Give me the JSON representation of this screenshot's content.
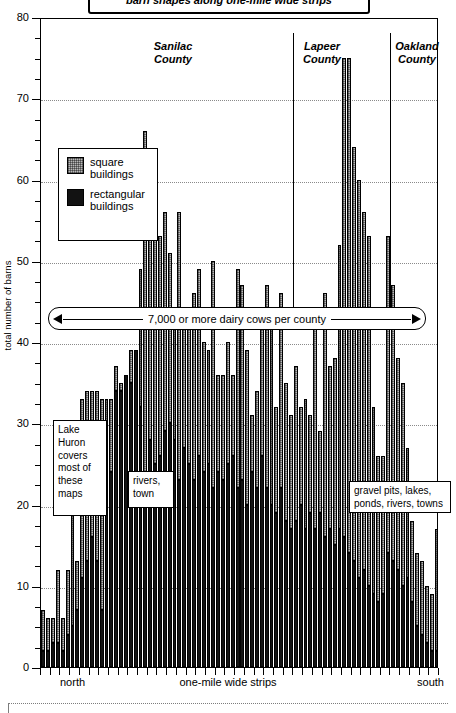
{
  "title": {
    "text": "barn shapes along one-mile wide strips"
  },
  "axes": {
    "y_title": "total number of barns",
    "y_ticks": [
      80,
      70,
      60,
      50,
      40,
      30,
      20,
      10,
      0
    ],
    "y_min": 0,
    "y_max": 80,
    "x_left_label": "north",
    "x_center_label": "one-mile wide strips",
    "x_right_label": "south"
  },
  "legend": {
    "items": [
      {
        "label_line1": "square",
        "label_line2": "buildings",
        "color": "#b9b9b9",
        "pattern": "hatched"
      },
      {
        "label_line1": "rectangular",
        "label_line2": "buildings",
        "color": "#121212",
        "pattern": "solid"
      }
    ]
  },
  "counties": [
    {
      "name_line1": "Sanilac",
      "name_line2": "County"
    },
    {
      "name_line1": "Lapeer",
      "name_line2": "County"
    },
    {
      "name_line1": "Oakland",
      "name_line2": "County"
    }
  ],
  "annotations": {
    "cow_band": "7,000 or more dairy cows per county",
    "lake_huron": "Lake\nHuron\ncovers\nmost of\nthese\nmaps",
    "rivers_town": "rivers,\ntown",
    "gravel_pits": "gravel pits, lakes,\nponds, rivers, towns"
  },
  "chart_data": {
    "type": "bar",
    "subtype": "stacked-vertical",
    "title": "barn shapes along one-mile wide strips",
    "xlabel": "one-mile wide strips",
    "ylabel": "total number of barns",
    "ylim": [
      0,
      80
    ],
    "ytick_step": 10,
    "grid": true,
    "legend_position": "inside-upper-left",
    "orientation": "north-to-south",
    "series": [
      {
        "name": "rectangular buildings",
        "color": "#121212",
        "values": [
          2,
          2,
          3,
          3,
          2,
          4,
          5,
          7,
          11,
          13,
          16,
          13,
          7,
          26,
          24,
          34,
          34,
          36,
          35,
          39,
          32,
          22,
          28,
          25,
          26,
          29,
          30,
          28,
          23,
          27,
          25,
          23,
          26,
          24,
          25,
          22,
          24,
          23,
          25,
          26,
          22,
          23,
          20,
          24,
          22,
          26,
          22,
          20,
          19,
          22,
          18,
          17,
          18,
          20,
          17,
          19,
          17,
          19,
          16,
          17,
          15,
          17,
          16,
          14,
          13,
          11,
          12,
          10,
          9,
          8,
          9,
          14,
          13,
          12,
          10,
          11,
          8,
          5,
          4,
          3,
          2,
          2
        ]
      },
      {
        "name": "square buildings",
        "color": "#b9b9b9",
        "values": [
          5,
          4,
          3,
          9,
          4,
          8,
          15,
          6,
          22,
          21,
          18,
          21,
          26,
          7,
          9,
          3,
          1,
          0,
          4,
          0,
          17,
          44,
          26,
          33,
          27,
          27,
          21,
          16,
          33,
          16,
          18,
          23,
          23,
          16,
          14,
          28,
          12,
          13,
          15,
          10,
          27,
          24,
          19,
          7,
          12,
          17,
          25,
          23,
          13,
          24,
          17,
          14,
          19,
          12,
          16,
          12,
          25,
          10,
          30,
          20,
          23,
          35,
          59,
          61,
          51,
          49,
          44,
          43,
          23,
          18,
          17,
          39,
          34,
          26,
          25,
          16,
          10,
          9,
          9,
          7,
          7,
          15
        ]
      }
    ],
    "totals": [
      7,
      6,
      6,
      12,
      6,
      12,
      20,
      13,
      33,
      34,
      34,
      34,
      33,
      33,
      33,
      37,
      35,
      36,
      39,
      39,
      49,
      66,
      54,
      58,
      53,
      56,
      51,
      44,
      56,
      43,
      43,
      46,
      49,
      40,
      39,
      50,
      36,
      36,
      40,
      36,
      49,
      47,
      39,
      31,
      34,
      43,
      47,
      43,
      32,
      46,
      35,
      31,
      37,
      32,
      33,
      31,
      42,
      29,
      46,
      37,
      38,
      52,
      75,
      75,
      64,
      60,
      56,
      53,
      32,
      26,
      26,
      53,
      47,
      38,
      35,
      27,
      18,
      14,
      13,
      10,
      9,
      17
    ],
    "bar_count": 82,
    "county_dividers_at_bar_index": [
      52,
      72
    ],
    "notes": [
      "7,000 or more dairy cows per county",
      "Lake Huron covers most of these maps",
      "rivers, town",
      "gravel pits, lakes, ponds, rivers, towns"
    ]
  }
}
